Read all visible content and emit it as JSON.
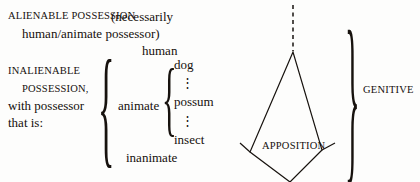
{
  "figure": {
    "kind": "linguistic-taxonomy-diagram",
    "background_color": "#fdfdfc",
    "ink_color": "#17120e"
  },
  "alienable": {
    "heading": "ALIENABLE POSSESSION",
    "qualifier_line1": "(necessarily",
    "qualifier_line2": "human/animate possessor)"
  },
  "inalienable": {
    "heading_line1": "INALIENABLE",
    "heading_line2": "POSSESSION,",
    "description_line1": "with possessor",
    "description_line2": "that is:"
  },
  "branches": {
    "animate_label": "animate",
    "inanimate_label": "inanimate",
    "human_label": "human",
    "animate_members": [
      "dog",
      "possum",
      "insect"
    ],
    "ellipsis": "⋮"
  },
  "relations": {
    "apposition_label": "APPOSITION",
    "genitive_label": "GENITIVE"
  },
  "braces": {
    "outer_open": "{",
    "inner_open": "{",
    "animate_group_open": "{",
    "genitive_close": "}"
  }
}
